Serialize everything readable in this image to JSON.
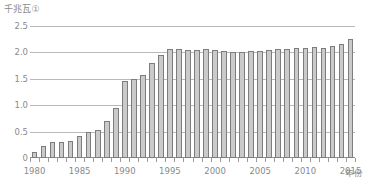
{
  "chart_data": {
    "type": "bar",
    "title": "",
    "subtitle": "",
    "xlabel": "年份",
    "ylabel": "千兆瓦①",
    "ylim": [
      0,
      2.5
    ],
    "xlim": [
      1980,
      2015
    ],
    "grid": true,
    "legend": null,
    "y_ticks": [
      "0",
      "0.5",
      "1.0",
      "1.5",
      "2.0",
      "2.5"
    ],
    "y_tick_values": [
      0,
      0.5,
      1.0,
      1.5,
      2.0,
      2.5
    ],
    "x_ticks": [
      "1980",
      "1985",
      "1990",
      "1995",
      "2000",
      "2005",
      "2010",
      "2015"
    ],
    "x_tick_values": [
      1980,
      1985,
      1990,
      1995,
      2000,
      2005,
      2010,
      2015
    ],
    "categories": [
      "1980",
      "1981",
      "1982",
      "1983",
      "1984",
      "1985",
      "1986",
      "1987",
      "1988",
      "1989",
      "1990",
      "1991",
      "1992",
      "1993",
      "1994",
      "1995",
      "1996",
      "1997",
      "1998",
      "1999",
      "2000",
      "2001",
      "2002",
      "2003",
      "2004",
      "2005",
      "2006",
      "2007",
      "2008",
      "2009",
      "2010",
      "2011",
      "2012",
      "2013",
      "2014",
      "2015"
    ],
    "values": [
      0.11,
      0.22,
      0.3,
      0.31,
      0.33,
      0.42,
      0.49,
      0.54,
      0.7,
      0.95,
      1.45,
      1.5,
      1.58,
      1.8,
      1.95,
      2.07,
      2.07,
      2.05,
      2.05,
      2.07,
      2.05,
      2.03,
      2.01,
      2.0,
      2.03,
      2.02,
      2.05,
      2.07,
      2.07,
      2.08,
      2.09,
      2.11,
      2.09,
      2.12,
      2.15,
      2.25
    ],
    "colors": {
      "bar_fill": "#cacaca",
      "bar_stroke": "#7d7d7d",
      "gridline": "#b9b9b9",
      "axis": "#8f8f8f",
      "text": "#8a8a8a",
      "background": "#ffffff"
    }
  }
}
